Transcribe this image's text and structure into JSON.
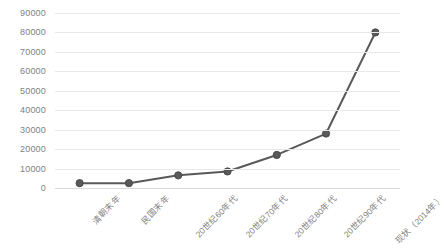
{
  "chart_data": {
    "type": "line",
    "title": "",
    "xlabel": "",
    "ylabel": "",
    "categories": [
      "清朝末年",
      "民国末年",
      "20世纪60年代",
      "20世纪70年代",
      "20世纪80年代",
      "20世纪90年代",
      "现状（2014年）"
    ],
    "values": [
      2500,
      2500,
      6500,
      8500,
      17000,
      28000,
      80000
    ],
    "ylim": [
      0,
      90000
    ],
    "yticks": [
      0,
      10000,
      20000,
      30000,
      40000,
      50000,
      60000,
      70000,
      80000,
      90000
    ],
    "ytick_labels": [
      "0",
      "10000",
      "20000",
      "30000",
      "40000",
      "50000",
      "60000",
      "70000",
      "80000",
      "90000"
    ],
    "grid": true,
    "legend": "none",
    "series_color": "#595959",
    "gridline_color": "#e8e8e8",
    "axis_text_color": "#7f7f7f",
    "background_color": "#ffffff",
    "marker": "circle"
  }
}
